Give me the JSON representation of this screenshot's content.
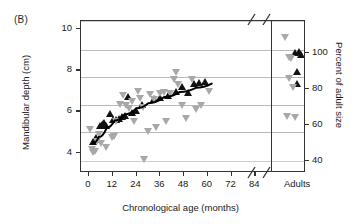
{
  "figure": {
    "panel_label": "(B)"
  },
  "chart_data": {
    "type": "scatter",
    "title": "",
    "xlabel": "Chronological age (months)",
    "ylabel": "Mandibular depth (cm)",
    "y2label": "Percent of adult size",
    "xlim": [
      -4,
      92
    ],
    "ylim": [
      3.0,
      10.4
    ],
    "y2lim": [
      33,
      118
    ],
    "grid": true,
    "legend_position": "none",
    "x_ticks": [
      0,
      12,
      24,
      36,
      48,
      60,
      72,
      84
    ],
    "x_tick_labels": [
      "0",
      "12",
      "24",
      "36",
      "48",
      "60",
      "72",
      "84"
    ],
    "x_category_label": "Adults",
    "axis_break": true,
    "y_ticks": [
      4,
      6,
      8,
      10
    ],
    "y_tick_labels": [
      "4",
      "6",
      "8",
      "10"
    ],
    "y2_ticks": [
      40,
      60,
      80,
      100
    ],
    "y2_tick_labels": [
      "40",
      "60",
      "80",
      "100"
    ],
    "gridlines_y": [
      3.6,
      5.0,
      6.3,
      7.7,
      9.0,
      10.4
    ],
    "series": [
      {
        "name": "male-mandibular-depth",
        "marker": "triangle-up",
        "color": "#111111",
        "points": [
          {
            "x": 2,
            "y": 4.5
          },
          {
            "x": 3,
            "y": 4.6
          },
          {
            "x": 4,
            "y": 4.7
          },
          {
            "x": 6,
            "y": 5.3
          },
          {
            "x": 6.6,
            "y": 5.35
          },
          {
            "x": 7.2,
            "y": 5.4
          },
          {
            "x": 8,
            "y": 5.45
          },
          {
            "x": 9,
            "y": 5.3
          },
          {
            "x": 11,
            "y": 5.9
          },
          {
            "x": 12.5,
            "y": 5.6
          },
          {
            "x": 14,
            "y": 5.6
          },
          {
            "x": 15.5,
            "y": 5.65
          },
          {
            "x": 17,
            "y": 5.75
          },
          {
            "x": 18.5,
            "y": 5.8
          },
          {
            "x": 20,
            "y": 6.7
          },
          {
            "x": 22,
            "y": 5.95
          },
          {
            "x": 24,
            "y": 6.05
          },
          {
            "x": 27,
            "y": 6.3
          },
          {
            "x": 33,
            "y": 6.6
          },
          {
            "x": 36,
            "y": 6.65
          },
          {
            "x": 40,
            "y": 6.75
          },
          {
            "x": 44,
            "y": 6.95
          },
          {
            "x": 47,
            "y": 7.2
          },
          {
            "x": 50,
            "y": 6.9
          },
          {
            "x": 53,
            "y": 7.35
          },
          {
            "x": 56,
            "y": 7.4
          },
          {
            "x": 59,
            "y": 7.45
          },
          {
            "x": 87.5,
            "y": 8.85
          },
          {
            "x": 88.5,
            "y": 8.9
          },
          {
            "x": 89,
            "y": 8.75
          },
          {
            "x": 88,
            "y": 7.95
          },
          {
            "x": 88,
            "y": 7.35
          }
        ]
      },
      {
        "name": "female-mandibular-depth",
        "marker": "triangle-down",
        "color": "#a8a8a8",
        "points": [
          {
            "x": 0.5,
            "y": 5.1
          },
          {
            "x": 1.5,
            "y": 4.15
          },
          {
            "x": 2.2,
            "y": 4.0
          },
          {
            "x": 3.2,
            "y": 4.05
          },
          {
            "x": 4.5,
            "y": 4.5
          },
          {
            "x": 5.5,
            "y": 4.85
          },
          {
            "x": 6.5,
            "y": 4.4
          },
          {
            "x": 9,
            "y": 4.25
          },
          {
            "x": 12,
            "y": 4.7
          },
          {
            "x": 13,
            "y": 4.75
          },
          {
            "x": 14,
            "y": 5.5
          },
          {
            "x": 16,
            "y": 6.3
          },
          {
            "x": 17.5,
            "y": 6.75
          },
          {
            "x": 19,
            "y": 6.25
          },
          {
            "x": 20.5,
            "y": 6.15
          },
          {
            "x": 22,
            "y": 6.45
          },
          {
            "x": 23,
            "y": 5.5
          },
          {
            "x": 25,
            "y": 6.95
          },
          {
            "x": 26,
            "y": 6.6
          },
          {
            "x": 27.5,
            "y": 6.2
          },
          {
            "x": 28,
            "y": 3.65
          },
          {
            "x": 30,
            "y": 5.0
          },
          {
            "x": 31,
            "y": 6.8
          },
          {
            "x": 33,
            "y": 6.55
          },
          {
            "x": 34,
            "y": 5.2
          },
          {
            "x": 36,
            "y": 6.85
          },
          {
            "x": 38,
            "y": 6.9
          },
          {
            "x": 39,
            "y": 5.5
          },
          {
            "x": 41,
            "y": 6.85
          },
          {
            "x": 43,
            "y": 7.55
          },
          {
            "x": 44,
            "y": 7.9
          },
          {
            "x": 45,
            "y": 7.3
          },
          {
            "x": 47,
            "y": 6.25
          },
          {
            "x": 49,
            "y": 5.65
          },
          {
            "x": 52,
            "y": 7.55
          },
          {
            "x": 54,
            "y": 6.1
          },
          {
            "x": 57,
            "y": 6.25
          },
          {
            "x": 61,
            "y": 6.95
          },
          {
            "x": 85,
            "y": 9.6
          },
          {
            "x": 86,
            "y": 8.6
          },
          {
            "x": 86.5,
            "y": 8.55
          },
          {
            "x": 86,
            "y": 7.6
          },
          {
            "x": 87,
            "y": 7.15
          },
          {
            "x": 85.5,
            "y": 5.75
          },
          {
            "x": 87.5,
            "y": 5.7
          }
        ]
      }
    ],
    "fit_curve": {
      "name": "growth-fit-curve",
      "color": "#000000",
      "description": "fitted growth curve through male mandibular depth",
      "points": [
        {
          "x": 2,
          "y": 4.45
        },
        {
          "x": 5,
          "y": 4.75
        },
        {
          "x": 9,
          "y": 5.2
        },
        {
          "x": 13,
          "y": 5.55
        },
        {
          "x": 18,
          "y": 5.85
        },
        {
          "x": 24,
          "y": 6.15
        },
        {
          "x": 30,
          "y": 6.4
        },
        {
          "x": 38,
          "y": 6.7
        },
        {
          "x": 46,
          "y": 6.95
        },
        {
          "x": 54,
          "y": 7.15
        },
        {
          "x": 62,
          "y": 7.35
        }
      ]
    }
  }
}
